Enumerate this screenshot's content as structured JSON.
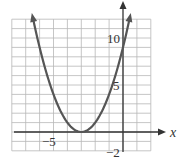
{
  "chart_data": {
    "type": "line",
    "title": "",
    "xlabel": "x",
    "ylabel": "",
    "xlim": [
      -8,
      2
    ],
    "ylim": [
      -2,
      12
    ],
    "grid": true,
    "function": "y = (x + 3)^2",
    "vertex": [
      -3,
      0
    ],
    "y_intercept": 9,
    "series": [
      {
        "name": "parabola",
        "x": [
          -6.5,
          -6,
          -5,
          -4,
          -3,
          -2,
          -1,
          0,
          0.5
        ],
        "values": [
          12.25,
          9,
          4,
          1,
          0,
          1,
          4,
          9,
          12.25
        ]
      }
    ],
    "tick_labels": {
      "x": [
        "-5"
      ],
      "y": [
        "10",
        "5",
        "-2"
      ]
    }
  },
  "labels": {
    "x_axis": "x",
    "x_tick_neg5": "−5",
    "y_tick_10": "10",
    "y_tick_5": "5",
    "y_tick_neg2": "−2"
  },
  "colors": {
    "grid": "#b8b8b8",
    "axis": "#333333",
    "curve": "#555555"
  }
}
